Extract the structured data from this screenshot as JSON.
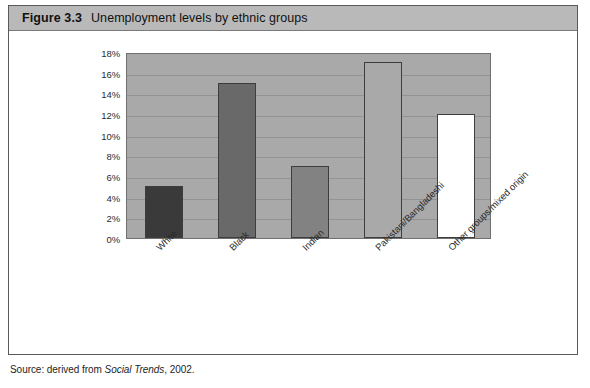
{
  "figure": {
    "number_label": "Figure 3.3",
    "caption": "Unemployment levels by ethnic groups"
  },
  "source": {
    "prefix": "Source: derived from ",
    "publication": "Social Trends",
    "suffix": ", 2002."
  },
  "colors": {
    "title_bar": "#b9b9b9",
    "plot_background": "#a9a9a9",
    "frame_border": "#5a5a5a",
    "gridline": "#8f8f8f",
    "bar_outline": "#3d3d3d"
  },
  "chart_data": {
    "type": "bar",
    "title": "Unemployment levels by ethnic groups",
    "xlabel": "",
    "ylabel": "",
    "ylim": [
      0,
      18
    ],
    "ytick_values": [
      18,
      16,
      14,
      12,
      10,
      8,
      6,
      4,
      2,
      0
    ],
    "ytick_labels": [
      "18%",
      "16%",
      "14%",
      "12%",
      "10%",
      "8%",
      "6%",
      "4%",
      "2%",
      "0%"
    ],
    "grid": true,
    "legend": false,
    "categories": [
      "White",
      "Black",
      "Indian",
      "Pakistani/Bangladeshi",
      "Other groups/mixed origin"
    ],
    "values": [
      5,
      15,
      7,
      17,
      12
    ],
    "bar_colors": [
      "#3a3a3a",
      "#696969",
      "#828282",
      "#a9a9a9",
      "#ffffff"
    ],
    "units": "percent"
  }
}
